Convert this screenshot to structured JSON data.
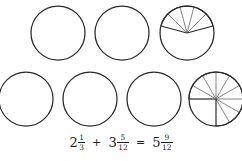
{
  "figure": {
    "stroke_color": "#2b2b2b",
    "minor_stroke_color": "#6e6e6e",
    "background_color": "#ffffff"
  },
  "rows": [
    {
      "name": "addends-row",
      "circles": [
        {
          "name": "circle-whole-1",
          "label": "whole circle",
          "filled_twelfths": 0,
          "divisions": 0,
          "cx": 58,
          "cy": 32,
          "r": 27
        },
        {
          "name": "circle-whole-2",
          "label": "whole circle",
          "filled_twelfths": 0,
          "divisions": 0,
          "cx": 122,
          "cy": 32,
          "r": 27
        },
        {
          "name": "circle-partial-5-12",
          "label": "five twelfths",
          "filled_twelfths": 5,
          "divisions": 5,
          "cx": 187,
          "cy": 32,
          "r": 27,
          "start_twelfth": -2.5
        }
      ]
    },
    {
      "name": "sum-row",
      "circles": [
        {
          "name": "circle-whole-3",
          "label": "whole circle",
          "filled_twelfths": 0,
          "divisions": 0,
          "cx": 26,
          "cy": 32,
          "r": 27
        },
        {
          "name": "circle-whole-4",
          "label": "whole circle",
          "filled_twelfths": 0,
          "divisions": 0,
          "cx": 90,
          "cy": 32,
          "r": 27
        },
        {
          "name": "circle-whole-5",
          "label": "whole circle",
          "filled_twelfths": 0,
          "divisions": 0,
          "cx": 154,
          "cy": 32,
          "r": 27
        },
        {
          "name": "circle-partial-9-12",
          "label": "nine twelfths",
          "filled_twelfths": 9,
          "divisions": 9,
          "cx": 216,
          "cy": 32,
          "r": 27,
          "start_twelfth": -3
        }
      ]
    }
  ],
  "equation": {
    "text": "2 1/3 + 3 5/12 = 5 9/12",
    "terms": [
      {
        "whole": "2",
        "numerator": "1",
        "denominator": "3"
      },
      {
        "whole": "3",
        "numerator": "5",
        "denominator": "12"
      },
      {
        "whole": "5",
        "numerator": "9",
        "denominator": "12"
      }
    ],
    "operator_add": "+",
    "operator_equals": "=",
    "first_whole": "2",
    "first_num": "1",
    "first_den": "3",
    "second_whole": "3",
    "second_num": "5",
    "second_den": "12",
    "result_whole": "5",
    "result_num": "9",
    "result_den": "12"
  }
}
